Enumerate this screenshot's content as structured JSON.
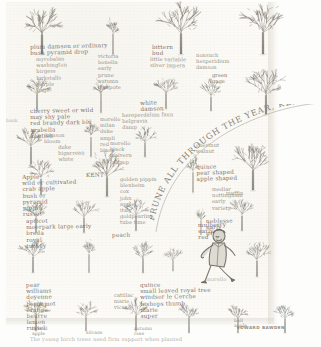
{
  "page": {
    "caption": "The young birch trees need firm support when planted",
    "signature": "EDWARD BAWDEN"
  },
  "arc_text": {
    "text": "PRUNE ALL THROUGH THE YEAR, KEEP BIRDS FROM THE BUDS"
  },
  "notes": [
    {
      "id": "n01",
      "text": "plum damson or ordinary\nbush pyramid drop",
      "x": 30,
      "y": 44,
      "rot": -1.5,
      "style": "head"
    },
    {
      "id": "n02",
      "text": "myrobalan\nwashington\nbirgess\nkirkstalls\npurple\ngage",
      "x": 36,
      "y": 56,
      "rot": -1,
      "style": ""
    },
    {
      "id": "n03",
      "text": "victoria\nbonella\nearly\nprune\nautumn\ncompote",
      "x": 98,
      "y": 53,
      "rot": 0,
      "style": ""
    },
    {
      "id": "n04",
      "text": "bittern\nbud",
      "x": 152,
      "y": 44,
      "rot": 0,
      "style": "head"
    },
    {
      "id": "n05",
      "text": "little variable\nsilver impera",
      "x": 150,
      "y": 56,
      "rot": 0.5,
      "style": ""
    },
    {
      "id": "n06",
      "text": "nonsuch\nhesperidium\ndamson",
      "x": 196,
      "y": 52,
      "rot": 0,
      "style": ""
    },
    {
      "id": "n07",
      "text": "green\ngage",
      "x": 212,
      "y": 72,
      "rot": 0,
      "style": "dark"
    },
    {
      "id": "n08",
      "text": "white\ndamson",
      "x": 140,
      "y": 100,
      "rot": -2,
      "style": "head"
    },
    {
      "id": "n09",
      "text": "hereperdalum faun\nbelgravia\ndamp",
      "x": 122,
      "y": 112,
      "rot": -1,
      "style": ""
    },
    {
      "id": "n10",
      "text": "cherry sweet or wild\nmay shy pale\nred brandy dark blu\narabella\nkentish",
      "x": 30,
      "y": 108,
      "rot": -1,
      "style": "head"
    },
    {
      "id": "n11",
      "text": "morello\nmilan\nduke\nampli\nred\nblack",
      "x": 100,
      "y": 116,
      "rot": 0,
      "style": ""
    },
    {
      "id": "n12",
      "text": "damson\nbloom",
      "x": 44,
      "y": 132,
      "rot": 0,
      "style": ""
    },
    {
      "id": "n13",
      "text": "duke\nbigarreau\nwhite",
      "x": 58,
      "y": 144,
      "rot": -1.5,
      "style": ""
    },
    {
      "id": "n14",
      "text": "morello\nblack\nmalvern\ncaltrop",
      "x": 110,
      "y": 140,
      "rot": 0,
      "style": ""
    },
    {
      "id": "n15",
      "text": "KENT",
      "x": 86,
      "y": 172,
      "rot": -1,
      "style": "head"
    },
    {
      "id": "n16",
      "text": "Apple\nwild or cultivated\ncrab apple\nbush or\npyramid\npippin\nrusset",
      "x": 22,
      "y": 174,
      "rot": -1.5,
      "style": "head"
    },
    {
      "id": "n17",
      "text": "golden pippin\nblenheim\ncox\njohn\napple\nitaly\ngoldpearline\ntube time",
      "x": 120,
      "y": 176,
      "rot": 0,
      "style": ""
    },
    {
      "id": "n18",
      "text": "apricot\nmoorpark large early\nbreda\nroyal\nturkey",
      "x": 26,
      "y": 218,
      "rot": -1,
      "style": "head"
    },
    {
      "id": "n19",
      "text": "peach",
      "x": 112,
      "y": 232,
      "rot": -1,
      "style": "head dark"
    },
    {
      "id": "n20",
      "text": "pear\nwilliams\ndoyenne\nbergamot\norange\nbeurre\nlemon\nrussel",
      "x": 26,
      "y": 282,
      "rot": -1,
      "style": "head"
    },
    {
      "id": "n21",
      "text": "catillac\nmarie\nvicar",
      "x": 114,
      "y": 292,
      "rot": 0,
      "style": ""
    },
    {
      "id": "n22",
      "text": "quince\npear shaped\napple shaped",
      "x": 196,
      "y": 164,
      "rot": -2,
      "style": "head"
    },
    {
      "id": "n23",
      "text": "chestnut\nwalnut",
      "x": 196,
      "y": 142,
      "rot": 0,
      "style": ""
    },
    {
      "id": "n24",
      "text": "medlar\nnottingham\nearly\nvariety",
      "x": 212,
      "y": 186,
      "rot": 0,
      "style": ""
    },
    {
      "id": "n25",
      "text": "mulberry\nearly\nred",
      "x": 198,
      "y": 222,
      "rot": -1,
      "style": "head"
    },
    {
      "id": "n26",
      "text": "morello",
      "x": 206,
      "y": 276,
      "rot": 0,
      "style": "faint"
    },
    {
      "id": "n27",
      "text": "quince\nsmall leaved royal tree\nwindsor le Cerche\nbishops thumb\nmarie\nsuper",
      "x": 140,
      "y": 282,
      "rot": -1,
      "style": "head"
    },
    {
      "id": "n28",
      "text": "hybrid\napple",
      "x": 32,
      "y": 326,
      "rot": 0,
      "style": "tiny"
    },
    {
      "id": "n29",
      "text": "silvans",
      "x": 86,
      "y": 330,
      "rot": 0,
      "style": "tiny"
    },
    {
      "id": "n30",
      "text": "autumn\nrose",
      "x": 134,
      "y": 326,
      "rot": 0,
      "style": "tiny"
    },
    {
      "id": "n31",
      "text": "bull\napple",
      "x": 234,
      "y": 318,
      "rot": 0,
      "style": "tiny"
    },
    {
      "id": "n32",
      "text": "bank",
      "x": 6,
      "y": 118,
      "rot": 0,
      "style": "faint tiny"
    },
    {
      "id": "n33",
      "text": "noblesse\nearly\ngrand",
      "x": 206,
      "y": 218,
      "rot": -1,
      "style": "head"
    },
    {
      "id": "n34",
      "text": "muffin",
      "x": 226,
      "y": 190,
      "rot": 0,
      "style": ""
    }
  ],
  "trees": [
    {
      "id": "t01",
      "kind": "broad",
      "x": 16,
      "y": 8,
      "w": 52,
      "h": 48
    },
    {
      "id": "t02",
      "kind": "slim",
      "x": 96,
      "y": 14,
      "w": 34,
      "h": 42
    },
    {
      "id": "t03",
      "kind": "broad",
      "x": 156,
      "y": 6,
      "w": 50,
      "h": 50
    },
    {
      "id": "t04",
      "kind": "broad",
      "x": 238,
      "y": 4,
      "w": 50,
      "h": 52
    },
    {
      "id": "t05",
      "kind": "small",
      "x": 18,
      "y": 74,
      "w": 38,
      "h": 38
    },
    {
      "id": "t06",
      "kind": "slim",
      "x": 84,
      "y": 76,
      "w": 34,
      "h": 38
    },
    {
      "id": "t07",
      "kind": "small",
      "x": 148,
      "y": 74,
      "w": 36,
      "h": 36
    },
    {
      "id": "t08",
      "kind": "small",
      "x": 194,
      "y": 78,
      "w": 34,
      "h": 34
    },
    {
      "id": "t09",
      "kind": "broad",
      "x": 244,
      "y": 70,
      "w": 44,
      "h": 46
    },
    {
      "id": "t10",
      "kind": "small",
      "x": 10,
      "y": 124,
      "w": 42,
      "h": 42
    },
    {
      "id": "t11",
      "kind": "slim",
      "x": 74,
      "y": 118,
      "w": 34,
      "h": 40
    },
    {
      "id": "t12",
      "kind": "small",
      "x": 128,
      "y": 124,
      "w": 34,
      "h": 34
    },
    {
      "id": "t13",
      "kind": "small",
      "x": 22,
      "y": 158,
      "w": 38,
      "h": 38
    },
    {
      "id": "t14",
      "kind": "broad",
      "x": 86,
      "y": 152,
      "w": 42,
      "h": 46
    },
    {
      "id": "t15",
      "kind": "slim",
      "x": 178,
      "y": 152,
      "w": 30,
      "h": 42
    },
    {
      "id": "t16",
      "kind": "broad",
      "x": 230,
      "y": 144,
      "w": 46,
      "h": 48
    },
    {
      "id": "t17",
      "kind": "small",
      "x": 18,
      "y": 198,
      "w": 36,
      "h": 36
    },
    {
      "id": "t18",
      "kind": "small",
      "x": 66,
      "y": 198,
      "w": 36,
      "h": 36
    },
    {
      "id": "t19",
      "kind": "small",
      "x": 118,
      "y": 196,
      "w": 36,
      "h": 36
    },
    {
      "id": "t20",
      "kind": "small",
      "x": 224,
      "y": 196,
      "w": 36,
      "h": 36
    },
    {
      "id": "t21",
      "kind": "small",
      "x": 14,
      "y": 236,
      "w": 38,
      "h": 38
    },
    {
      "id": "t22",
      "kind": "slim",
      "x": 74,
      "y": 236,
      "w": 30,
      "h": 38
    },
    {
      "id": "t23",
      "kind": "small",
      "x": 126,
      "y": 240,
      "w": 34,
      "h": 34
    },
    {
      "id": "t24",
      "kind": "slim",
      "x": 188,
      "y": 206,
      "w": 26,
      "h": 30
    },
    {
      "id": "t25",
      "kind": "small",
      "x": 238,
      "y": 240,
      "w": 38,
      "h": 38
    },
    {
      "id": "t26",
      "kind": "small",
      "x": 18,
      "y": 296,
      "w": 36,
      "h": 36
    },
    {
      "id": "t27",
      "kind": "small",
      "x": 70,
      "y": 300,
      "w": 32,
      "h": 32
    },
    {
      "id": "t28",
      "kind": "small",
      "x": 118,
      "y": 296,
      "w": 36,
      "h": 36
    },
    {
      "id": "t29",
      "kind": "small",
      "x": 172,
      "y": 300,
      "w": 34,
      "h": 34
    },
    {
      "id": "t30",
      "kind": "small",
      "x": 222,
      "y": 302,
      "w": 32,
      "h": 32
    },
    {
      "id": "t31",
      "kind": "small",
      "x": 268,
      "y": 300,
      "w": 34,
      "h": 34
    },
    {
      "id": "t32",
      "kind": "small",
      "x": 160,
      "y": 246,
      "w": 26,
      "h": 26
    }
  ],
  "figure": {
    "name": "walking-man",
    "x": 200,
    "y": 228
  }
}
